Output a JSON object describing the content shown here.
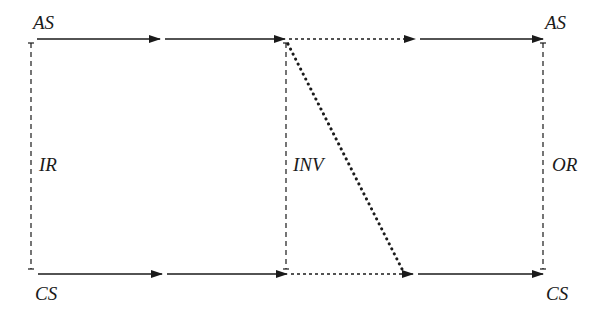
{
  "diagram": {
    "title": "",
    "colors": {
      "ink": "#1a1a1a",
      "background": "#ffffff"
    },
    "labels": {
      "top_left": "AS",
      "top_right": "AS",
      "bottom_left": "CS",
      "bottom_right": "CS",
      "left_vertical": "IR",
      "middle_vertical": "INV",
      "right_vertical": "OR"
    },
    "edges": [
      {
        "id": "top-1",
        "style": "solid",
        "from": [
          37,
          39
        ],
        "to": [
          160,
          39
        ]
      },
      {
        "id": "top-2",
        "style": "solid",
        "from": [
          165,
          39
        ],
        "to": [
          285,
          39
        ]
      },
      {
        "id": "top-3",
        "style": "dotted",
        "from": [
          287,
          39
        ],
        "to": [
          415,
          39
        ]
      },
      {
        "id": "top-4",
        "style": "solid",
        "from": [
          420,
          39
        ],
        "to": [
          543,
          39
        ]
      },
      {
        "id": "bottom-1",
        "style": "solid",
        "from": [
          38,
          274
        ],
        "to": [
          162,
          274
        ]
      },
      {
        "id": "bottom-2",
        "style": "solid",
        "from": [
          167,
          274
        ],
        "to": [
          287,
          274
        ]
      },
      {
        "id": "bottom-3",
        "style": "dotted",
        "from": [
          289,
          274
        ],
        "to": [
          413,
          274
        ]
      },
      {
        "id": "bottom-4",
        "style": "solid",
        "from": [
          418,
          274
        ],
        "to": [
          543,
          274
        ]
      },
      {
        "id": "vertical-IR",
        "style": "dashed",
        "from": [
          31,
          43
        ],
        "to": [
          31,
          269
        ]
      },
      {
        "id": "vertical-INV",
        "style": "dashed",
        "from": [
          286,
          43
        ],
        "to": [
          286,
          269
        ]
      },
      {
        "id": "vertical-OR",
        "style": "dashed",
        "from": [
          543,
          43
        ],
        "to": [
          543,
          269
        ]
      },
      {
        "id": "diagonal",
        "style": "heavy-dotted",
        "from": [
          288,
          43
        ],
        "to": [
          403,
          271
        ]
      }
    ]
  }
}
